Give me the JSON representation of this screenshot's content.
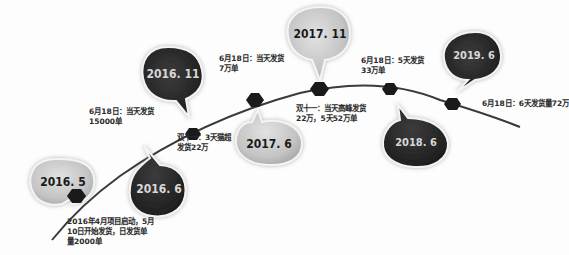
{
  "timeline": {
    "milestones": [
      {
        "date": "2016. 5",
        "style": "light",
        "line1": "2016年4月项目启动，5月",
        "line2": "10日开始发货，日发货单",
        "line3": "量2000单"
      },
      {
        "date": "2016. 6",
        "style": "dark",
        "line1": "双十一：3天猫超",
        "line2": "发货22万"
      },
      {
        "date": "2016. 11",
        "style": "dark",
        "line1": "6月18日：当天发货",
        "line2": "15000单"
      },
      {
        "date": "2017. 6",
        "style": "light",
        "line1": "6月18日：当天发货",
        "line2": "7万单"
      },
      {
        "date": "2017. 11",
        "style": "light",
        "line1": "双十一：当天高峰发货",
        "line2": "22万，5天52万单"
      },
      {
        "date": "2018. 6",
        "style": "dark",
        "line1": "6月18日：5天发货",
        "line2": "33万单"
      },
      {
        "date": "2019. 6",
        "style": "dark",
        "line1": "6月18日：6天发货量72万"
      }
    ]
  },
  "colors": {
    "curve": "#3a3a3a",
    "node": "#1a1a1a",
    "bubble_dark": "#2b2b2b",
    "bubble_light": "#c9c9c9",
    "text": "#2a2a2a",
    "bubble_dark_text": "#d8d8d8",
    "bubble_light_text": "#1a1a1a"
  }
}
